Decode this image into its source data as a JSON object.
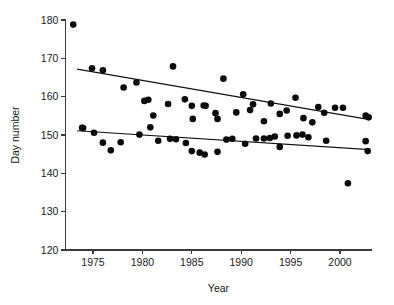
{
  "chart_data": {
    "type": "scatter",
    "title": "",
    "xlabel": "Year",
    "ylabel": "Day number",
    "xlim": [
      1972.2,
      2003.2
    ],
    "ylim": [
      120,
      180
    ],
    "xticks": [
      1975,
      1980,
      1985,
      1990,
      1995,
      2000
    ],
    "xtick_labels": [
      "1975",
      "1980",
      "1985",
      "1990",
      "1995",
      "2000"
    ],
    "yticks": [
      120,
      130,
      140,
      150,
      160,
      170,
      180
    ],
    "ytick_labels": [
      "120",
      "130",
      "140",
      "150",
      "160",
      "170",
      "180"
    ],
    "grid": false,
    "legend": "none",
    "marker": "filled-circle",
    "series": [
      {
        "name": "upper-series",
        "points": [
          [
            1973.0,
            178.8
          ],
          [
            1974.0,
            151.8
          ],
          [
            1974.9,
            167.4
          ],
          [
            1976.0,
            166.9
          ],
          [
            1978.1,
            162.4
          ],
          [
            1979.4,
            163.7
          ],
          [
            1980.2,
            158.9
          ],
          [
            1980.6,
            159.2
          ],
          [
            1981.1,
            155.1
          ],
          [
            1982.6,
            158.1
          ],
          [
            1983.1,
            167.9
          ],
          [
            1984.3,
            159.3
          ],
          [
            1985.0,
            157.6
          ],
          [
            1985.1,
            154.2
          ],
          [
            1986.2,
            157.7
          ],
          [
            1986.4,
            157.6
          ],
          [
            1987.4,
            155.7
          ],
          [
            1987.6,
            154.2
          ],
          [
            1988.2,
            164.7
          ],
          [
            1989.5,
            155.9
          ],
          [
            1990.2,
            160.6
          ],
          [
            1990.9,
            156.5
          ],
          [
            1991.2,
            158.0
          ],
          [
            1992.3,
            153.6
          ],
          [
            1993.0,
            158.2
          ],
          [
            1993.9,
            155.5
          ],
          [
            1994.6,
            156.4
          ],
          [
            1995.5,
            159.7
          ],
          [
            1996.3,
            154.4
          ],
          [
            1997.2,
            153.3
          ],
          [
            1997.8,
            157.3
          ],
          [
            1998.4,
            155.8
          ],
          [
            1999.5,
            157.1
          ],
          [
            2000.3,
            157.1
          ],
          [
            2002.6,
            155.1
          ],
          [
            2002.9,
            154.6
          ]
        ]
      },
      {
        "name": "lower-series",
        "points": [
          [
            1973.9,
            151.9
          ],
          [
            1975.1,
            150.6
          ],
          [
            1976.0,
            148.0
          ],
          [
            1976.8,
            146.0
          ],
          [
            1977.8,
            148.1
          ],
          [
            1979.7,
            150.1
          ],
          [
            1980.8,
            152.0
          ],
          [
            1981.6,
            148.5
          ],
          [
            1982.8,
            149.0
          ],
          [
            1983.4,
            148.9
          ],
          [
            1984.4,
            147.9
          ],
          [
            1985.0,
            145.8
          ],
          [
            1985.8,
            145.4
          ],
          [
            1986.3,
            144.9
          ],
          [
            1987.6,
            145.6
          ],
          [
            1988.5,
            148.8
          ],
          [
            1989.1,
            149.0
          ],
          [
            1990.4,
            147.7
          ],
          [
            1991.5,
            149.1
          ],
          [
            1992.3,
            149.1
          ],
          [
            1992.9,
            149.2
          ],
          [
            1993.4,
            149.6
          ],
          [
            1993.9,
            146.9
          ],
          [
            1994.7,
            149.8
          ],
          [
            1995.6,
            149.9
          ],
          [
            1996.2,
            150.1
          ],
          [
            1996.8,
            149.4
          ],
          [
            1998.6,
            148.5
          ],
          [
            2000.8,
            137.4
          ],
          [
            2002.6,
            148.4
          ],
          [
            2002.8,
            145.8
          ]
        ]
      }
    ],
    "trend_lines": [
      {
        "name": "upper-trend",
        "x": [
          1973.4,
          2003.0
        ],
        "y": [
          167.2,
          154.0
        ]
      },
      {
        "name": "lower-trend",
        "x": [
          1973.4,
          2003.0
        ],
        "y": [
          151.1,
          146.2
        ]
      }
    ]
  }
}
